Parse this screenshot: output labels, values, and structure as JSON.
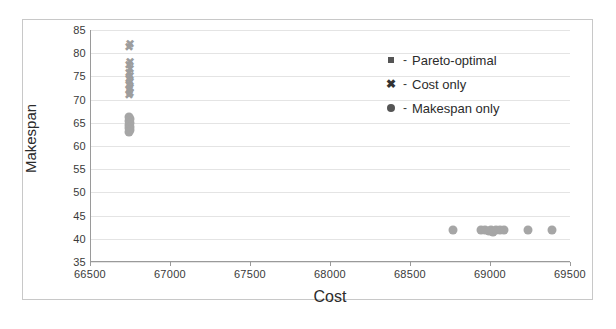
{
  "chart_data": {
    "type": "scatter",
    "title": "",
    "xlabel": "Cost",
    "ylabel": "Makespan",
    "xlim": [
      66500,
      69500
    ],
    "ylim": [
      35,
      85
    ],
    "xticks": [
      66500,
      67000,
      67500,
      68000,
      68500,
      69000,
      69500
    ],
    "yticks": [
      85,
      80,
      75,
      70,
      65,
      60,
      55,
      50,
      45,
      40,
      35
    ],
    "grid": true,
    "legend_position": "upper-right",
    "marker_color": "#a6a6a6",
    "gridline_color": "#e4e4e4",
    "axis_color": "#9a9a9a",
    "series": [
      {
        "name": "Pareto-optimal",
        "marker": "square",
        "points": []
      },
      {
        "name": "Cost only",
        "marker": "cross",
        "points": [
          {
            "x": 66742,
            "y": 82.0
          },
          {
            "x": 66740,
            "y": 81.4
          },
          {
            "x": 66741,
            "y": 78.2
          },
          {
            "x": 66740,
            "y": 77.4
          },
          {
            "x": 66741,
            "y": 76.6
          },
          {
            "x": 66740,
            "y": 75.8
          },
          {
            "x": 66742,
            "y": 75.1
          },
          {
            "x": 66740,
            "y": 74.4
          },
          {
            "x": 66741,
            "y": 73.8
          },
          {
            "x": 66740,
            "y": 73.2
          },
          {
            "x": 66741,
            "y": 72.6
          },
          {
            "x": 66740,
            "y": 72.0
          },
          {
            "x": 66742,
            "y": 71.4
          },
          {
            "x": 66740,
            "y": 71.0
          }
        ]
      },
      {
        "name": "Makespan only",
        "marker": "circle",
        "points": [
          {
            "x": 66740,
            "y": 66.2
          },
          {
            "x": 66742,
            "y": 65.8
          },
          {
            "x": 66739,
            "y": 65.4
          },
          {
            "x": 66741,
            "y": 65.0
          },
          {
            "x": 66740,
            "y": 64.6
          },
          {
            "x": 66742,
            "y": 64.2
          },
          {
            "x": 66739,
            "y": 63.8
          },
          {
            "x": 66741,
            "y": 63.4
          },
          {
            "x": 66740,
            "y": 63.0
          },
          {
            "x": 68760,
            "y": 41.8
          },
          {
            "x": 68940,
            "y": 42.0
          },
          {
            "x": 68965,
            "y": 41.9
          },
          {
            "x": 68985,
            "y": 41.6
          },
          {
            "x": 69000,
            "y": 42.0
          },
          {
            "x": 69010,
            "y": 41.5
          },
          {
            "x": 69030,
            "y": 41.9
          },
          {
            "x": 69055,
            "y": 42.0
          },
          {
            "x": 69080,
            "y": 41.8
          },
          {
            "x": 69230,
            "y": 41.9
          },
          {
            "x": 69380,
            "y": 41.8
          }
        ]
      }
    ]
  },
  "legend": {
    "items": [
      {
        "marker": "square-marker",
        "dash": "-",
        "label": "Pareto-optimal"
      },
      {
        "marker": "cross-marker",
        "dash": "-",
        "label": "Cost only"
      },
      {
        "marker": "circle-marker",
        "dash": "-",
        "label": "Makespan only"
      }
    ]
  },
  "glyphs": {
    "cross": "✖",
    "legend_cross": "✖"
  }
}
